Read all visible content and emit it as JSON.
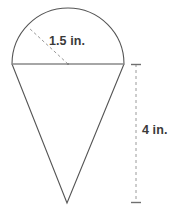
{
  "figure": {
    "background_color": "#ffffff",
    "stroke_color": "#555555",
    "diameter_color": "#888888",
    "dash_color": "#9a9a9a",
    "text_color": "#3a3a3a",
    "labels": {
      "radius": "1.5 in.",
      "height": "4 in."
    },
    "geometry": {
      "circle_center": {
        "x": 68,
        "y": 64
      },
      "circle_radius": 56,
      "diameter_left": {
        "x": 12,
        "y": 64
      },
      "diameter_right": {
        "x": 124,
        "y": 64
      },
      "arc_top": {
        "x": 68,
        "y": 9
      },
      "apex": {
        "x": 67,
        "y": 203
      },
      "radius_line_end": {
        "x": 29,
        "y": 28
      },
      "dimension_line_x": 136,
      "dimension_top_y": 64,
      "dimension_bottom_y": 203,
      "tick_half_width": 5
    }
  }
}
